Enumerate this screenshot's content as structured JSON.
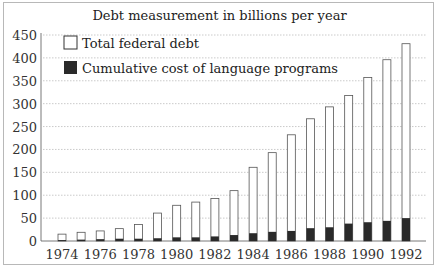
{
  "chart_data": {
    "type": "bar",
    "title": "Debt measurement in billions per year",
    "xlabel": "",
    "ylabel": "",
    "ylim": [
      0,
      450
    ],
    "yticks": [
      0,
      50,
      100,
      150,
      200,
      250,
      300,
      350,
      400,
      450
    ],
    "grid": true,
    "legend_position": "upper-left",
    "categories": [
      "1974",
      "1975",
      "1976",
      "1977",
      "1978",
      "1979",
      "1980",
      "1981",
      "1982",
      "1983",
      "1984",
      "1985",
      "1986",
      "1987",
      "1988",
      "1989",
      "1990",
      "1991",
      "1992"
    ],
    "xtick_labels": [
      "1974",
      "1976",
      "1978",
      "1980",
      "1982",
      "1984",
      "1986",
      "1988",
      "1990",
      "1992"
    ],
    "series": [
      {
        "name": "Total federal debt",
        "color": "#ffffff",
        "values": [
          15,
          19,
          22,
          27,
          36,
          61,
          78,
          85,
          93,
          110,
          161,
          193,
          232,
          267,
          293,
          318,
          357,
          396,
          431
        ]
      },
      {
        "name": "Cumulative cost of language programs",
        "color": "#2a2a2a",
        "values": [
          2,
          3,
          4,
          5,
          5,
          6,
          8,
          8,
          10,
          13,
          17,
          20,
          22,
          28,
          30,
          38,
          41,
          44,
          50
        ]
      }
    ]
  }
}
